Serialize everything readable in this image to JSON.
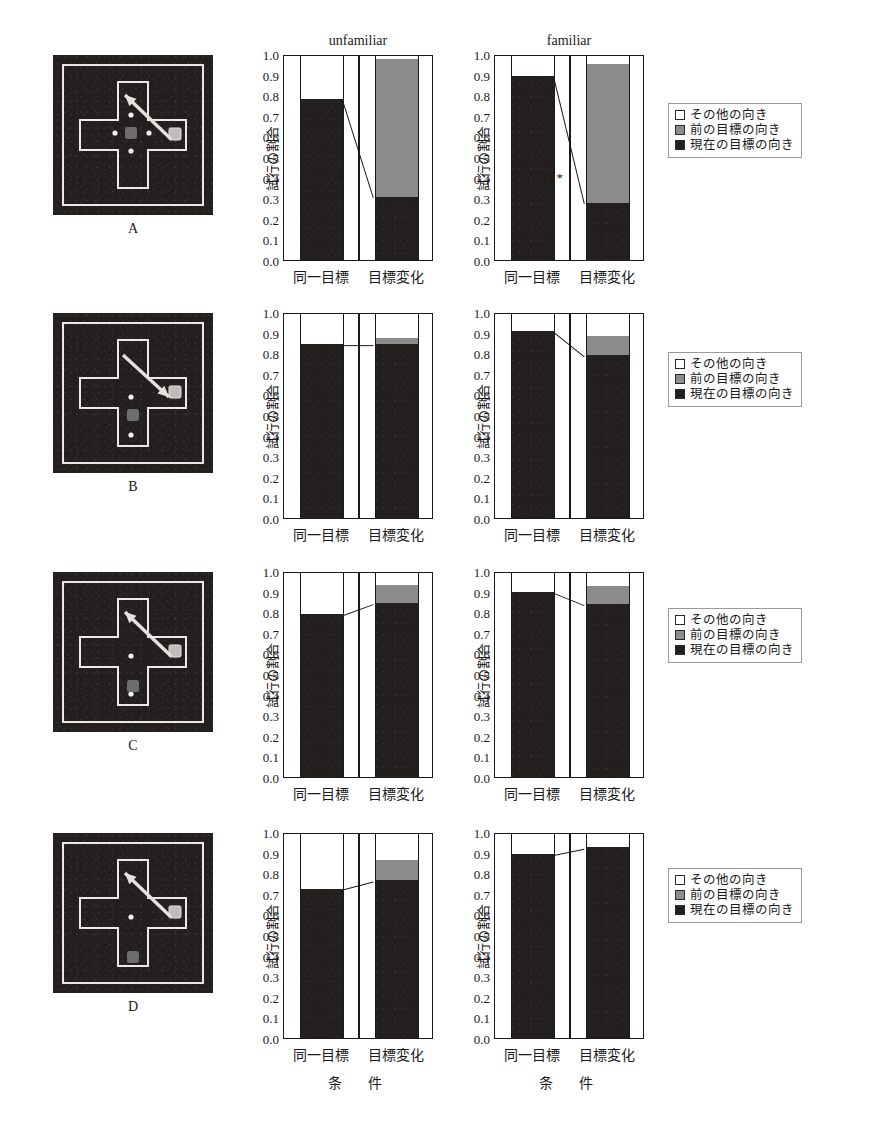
{
  "figure": {
    "column_titles": [
      "unfamiliar",
      "familiar"
    ],
    "ylabel": "試行の割合",
    "xlabel": "条　件",
    "categories": [
      "同一目標",
      "目標変化"
    ],
    "ylim": [
      0.0,
      1.0
    ],
    "yticks": [
      "0.0",
      "0.1",
      "0.2",
      "0.3",
      "0.4",
      "0.5",
      "0.6",
      "0.7",
      "0.8",
      "0.9",
      "1.0"
    ],
    "ytick_values": [
      0.0,
      0.1,
      0.2,
      0.3,
      0.4,
      0.5,
      0.6,
      0.7,
      0.8,
      0.9,
      1.0
    ]
  },
  "legend": {
    "items": [
      {
        "swatch": "other",
        "label": "その他の向き"
      },
      {
        "swatch": "previous",
        "label": "前の目標の向き"
      },
      {
        "swatch": "current",
        "label": "現在の目標の向き"
      }
    ]
  },
  "panels": [
    {
      "id": "A",
      "label": "A",
      "arrow": "up-left",
      "start_box": "center",
      "dots": "cross-center"
    },
    {
      "id": "B",
      "label": "B",
      "arrow": "down-right",
      "start_box": "lower-arm-upper",
      "dots": "lower-arm"
    },
    {
      "id": "C",
      "label": "C",
      "arrow": "up-left",
      "start_box": "lower-arm-mid",
      "dots": "lower-arm"
    },
    {
      "id": "D",
      "label": "D",
      "arrow": "up-left",
      "start_box": "lower-arm-low",
      "dots": "lower-arm"
    }
  ],
  "chart_data": [
    {
      "type": "bar",
      "panel": "A",
      "title": "unfamiliar",
      "xlabel": "条　件",
      "ylabel": "試行の割合",
      "ylim": [
        0.0,
        1.0
      ],
      "grid": false,
      "stacked": true,
      "categories": [
        "同一目標",
        "目標変化"
      ],
      "series": [
        {
          "name": "現在の目標の向き",
          "values": [
            0.78,
            0.305
          ]
        },
        {
          "name": "前の目標の向き",
          "values": [
            0.0,
            0.67
          ]
        },
        {
          "name": "その他の向き",
          "values": [
            0.22,
            0.025
          ]
        }
      ],
      "annotation": "*",
      "connector": [
        0.78,
        0.305
      ]
    },
    {
      "type": "bar",
      "panel": "A",
      "title": "familiar",
      "xlabel": "条　件",
      "ylabel": "試行の割合",
      "ylim": [
        0.0,
        1.0
      ],
      "grid": false,
      "stacked": true,
      "categories": [
        "同一目標",
        "目標変化"
      ],
      "series": [
        {
          "name": "現在の目標の向き",
          "values": [
            0.895,
            0.275
          ]
        },
        {
          "name": "前の目標の向き",
          "values": [
            0.0,
            0.675
          ]
        },
        {
          "name": "その他の向き",
          "values": [
            0.105,
            0.05
          ]
        }
      ],
      "annotation": "**",
      "connector": [
        0.895,
        0.275
      ]
    },
    {
      "type": "bar",
      "panel": "B",
      "title": "unfamiliar",
      "xlabel": "条　件",
      "ylabel": "試行の割合",
      "ylim": [
        0.0,
        1.0
      ],
      "grid": false,
      "stacked": true,
      "categories": [
        "同一目標",
        "目標変化"
      ],
      "series": [
        {
          "name": "現在の目標の向き",
          "values": [
            0.845,
            0.845
          ]
        },
        {
          "name": "前の目標の向き",
          "values": [
            0.0,
            0.03
          ]
        },
        {
          "name": "その他の向き",
          "values": [
            0.155,
            0.125
          ]
        }
      ],
      "annotation": "",
      "connector": [
        0.845,
        0.845
      ]
    },
    {
      "type": "bar",
      "panel": "B",
      "title": "familiar",
      "xlabel": "条　件",
      "ylabel": "試行の割合",
      "ylim": [
        0.0,
        1.0
      ],
      "grid": false,
      "stacked": true,
      "categories": [
        "同一目標",
        "目標変化"
      ],
      "series": [
        {
          "name": "現在の目標の向き",
          "values": [
            0.91,
            0.79
          ]
        },
        {
          "name": "前の目標の向き",
          "values": [
            0.0,
            0.095
          ]
        },
        {
          "name": "その他の向き",
          "values": [
            0.09,
            0.115
          ]
        }
      ],
      "annotation": "",
      "connector": [
        0.91,
        0.79
      ]
    },
    {
      "type": "bar",
      "panel": "C",
      "title": "unfamiliar",
      "xlabel": "条　件",
      "ylabel": "試行の割合",
      "ylim": [
        0.0,
        1.0
      ],
      "grid": false,
      "stacked": true,
      "categories": [
        "同一目標",
        "目標変化"
      ],
      "series": [
        {
          "name": "現在の目標の向き",
          "values": [
            0.79,
            0.845
          ]
        },
        {
          "name": "前の目標の向き",
          "values": [
            0.0,
            0.085
          ]
        },
        {
          "name": "その他の向き",
          "values": [
            0.21,
            0.07
          ]
        }
      ],
      "annotation": "",
      "connector": [
        0.79,
        0.845
      ]
    },
    {
      "type": "bar",
      "panel": "C",
      "title": "familiar",
      "xlabel": "条　件",
      "ylabel": "試行の割合",
      "ylim": [
        0.0,
        1.0
      ],
      "grid": false,
      "stacked": true,
      "categories": [
        "同一目標",
        "目標変化"
      ],
      "series": [
        {
          "name": "現在の目標の向き",
          "values": [
            0.9,
            0.84
          ]
        },
        {
          "name": "前の目標の向き",
          "values": [
            0.0,
            0.085
          ]
        },
        {
          "name": "その他の向き",
          "values": [
            0.1,
            0.075
          ]
        }
      ],
      "annotation": "",
      "connector": [
        0.9,
        0.84
      ]
    },
    {
      "type": "bar",
      "panel": "D",
      "title": "unfamiliar",
      "xlabel": "条　件",
      "ylabel": "試行の割合",
      "ylim": [
        0.0,
        1.0
      ],
      "grid": false,
      "stacked": true,
      "categories": [
        "同一目標",
        "目標変化"
      ],
      "series": [
        {
          "name": "現在の目標の向き",
          "values": [
            0.725,
            0.765
          ]
        },
        {
          "name": "前の目標の向き",
          "values": [
            0.0,
            0.1
          ]
        },
        {
          "name": "その他の向き",
          "values": [
            0.275,
            0.135
          ]
        }
      ],
      "annotation": "",
      "connector": [
        0.725,
        0.765
      ]
    },
    {
      "type": "bar",
      "panel": "D",
      "title": "familiar",
      "xlabel": "条　件",
      "ylabel": "試行の割合",
      "ylim": [
        0.0,
        1.0
      ],
      "grid": false,
      "stacked": true,
      "categories": [
        "同一目標",
        "目標変化"
      ],
      "series": [
        {
          "name": "現在の目標の向き",
          "values": [
            0.895,
            0.925
          ]
        },
        {
          "name": "前の目標の向き",
          "values": [
            0.0,
            0.0
          ]
        },
        {
          "name": "その他の向き",
          "values": [
            0.105,
            0.075
          ]
        }
      ],
      "annotation": "",
      "connector": [
        0.895,
        0.925
      ]
    }
  ]
}
